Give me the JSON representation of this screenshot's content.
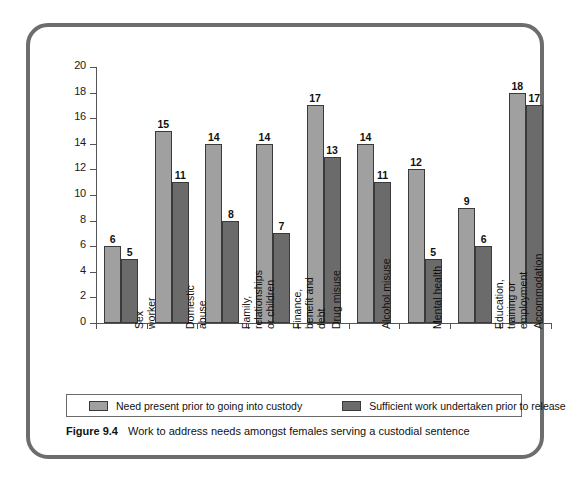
{
  "figure": {
    "number_label": "Figure 9.4",
    "caption": "Work to address needs amongst females serving a custodial sentence"
  },
  "legend": {
    "position": "bottom",
    "items": [
      {
        "label": "Need present prior to going into custody",
        "color": "#a0a0a0"
      },
      {
        "label": "Sufficient work undertaken prior to release",
        "color": "#6b6b6b"
      }
    ]
  },
  "axis": {
    "y_ticks": [
      "0",
      "2",
      "4",
      "6",
      "8",
      "10",
      "12",
      "14",
      "16",
      "18",
      "20"
    ]
  },
  "chart_data": {
    "type": "bar",
    "title": "Work to address needs amongst females serving a custodial sentence",
    "xlabel": "",
    "ylabel": "",
    "ylim": [
      0,
      20
    ],
    "ytick_step": 2,
    "grid": false,
    "legend_position": "bottom",
    "categories": [
      "Sex worker",
      "Domestic abuse",
      "Family, relationships or children",
      "Finance, benefit and debt",
      "Drug misuse",
      "Alcohol misuse",
      "Mental health",
      "Education, training or employment",
      "Accommodation"
    ],
    "category_lines": [
      [
        "Sex",
        "worker"
      ],
      [
        "Domestic",
        "abuse"
      ],
      [
        "Family,",
        "relationships",
        "or children"
      ],
      [
        "Finance,",
        "benefit and",
        "debt"
      ],
      [
        "Drug misuse"
      ],
      [
        "Alcohol misuse"
      ],
      [
        "Mental health"
      ],
      [
        "Education,",
        "training or",
        "employment"
      ],
      [
        "Accommodation"
      ]
    ],
    "series": [
      {
        "name": "Need present prior to going into custody",
        "color": "#a0a0a0",
        "values": [
          6,
          15,
          14,
          14,
          17,
          14,
          12,
          9,
          18
        ]
      },
      {
        "name": "Sufficient work undertaken prior to release",
        "color": "#6b6b6b",
        "values": [
          5,
          11,
          8,
          7,
          13,
          11,
          5,
          6,
          17
        ]
      }
    ]
  }
}
